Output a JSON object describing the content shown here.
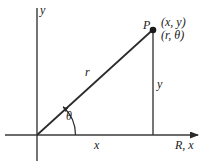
{
  "figure": {
    "type": "geometry-diagram",
    "background_color": "#ffffff",
    "line_color": "#2a2a2a",
    "labels": {
      "y_axis": "y",
      "point_name": "P",
      "rect_coords": "(x, y)",
      "polar_coords": "(r, θ)",
      "radius": "r",
      "vertical_leg": "y",
      "angle": "θ",
      "horizontal_leg": "x",
      "x_axis": "R, x"
    },
    "geometry": {
      "origin": [
        37,
        135
      ],
      "point_p": [
        153,
        30
      ],
      "x_axis_start": [
        5,
        135
      ],
      "x_axis_end": [
        202,
        135
      ],
      "y_axis_top": [
        37,
        8
      ],
      "y_axis_bottom": [
        37,
        161
      ],
      "foot_of_perpendicular": [
        153,
        135
      ],
      "angle_arc_radius": 38,
      "dot_radius": 3.2
    }
  }
}
